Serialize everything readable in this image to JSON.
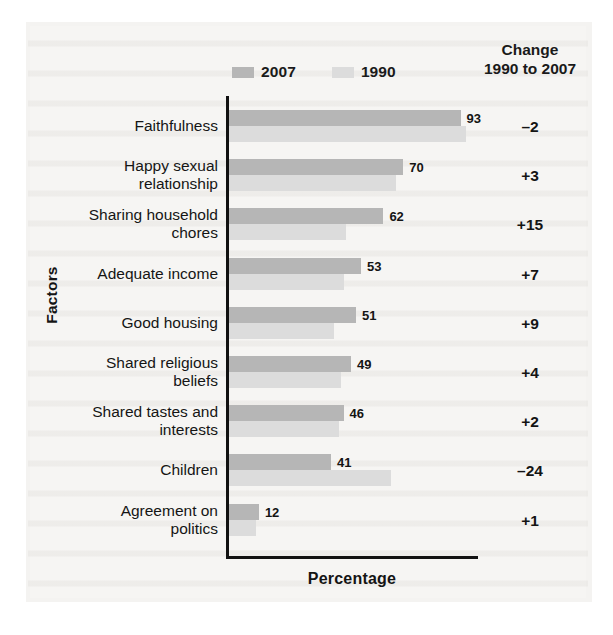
{
  "legend": {
    "items": [
      {
        "label": "2007",
        "color": "#b6b6b6",
        "swatch_name": "legend-swatch-2007"
      },
      {
        "label": "1990",
        "color": "#dcdcdc",
        "swatch_name": "legend-swatch-1990"
      }
    ]
  },
  "change_header": {
    "line1": "Change",
    "line2": "1990 to 2007"
  },
  "axes": {
    "y_title": "Factors",
    "x_title": "Percentage"
  },
  "chart_data": {
    "type": "bar",
    "orientation": "horizontal",
    "title": "",
    "subtitle": "",
    "xlabel": "Percentage",
    "ylabel": "Factors",
    "xlim": [
      0,
      100
    ],
    "grid": false,
    "legend_position": "top",
    "categories": [
      "Faithfulness",
      "Happy sexual relationship",
      "Sharing household chores",
      "Adequate income",
      "Good housing",
      "Shared religious beliefs",
      "Shared tastes and interests",
      "Children",
      "Agreement on politics"
    ],
    "series": [
      {
        "name": "2007",
        "color": "#b6b6b6",
        "values": [
          93,
          70,
          62,
          53,
          51,
          49,
          46,
          41,
          12
        ]
      },
      {
        "name": "1990",
        "color": "#dcdcdc",
        "values": [
          95,
          67,
          47,
          46,
          42,
          45,
          44,
          65,
          11
        ]
      }
    ],
    "annotations": {
      "column_header": "Change 1990 to 2007",
      "change_1990_to_2007": [
        "–2",
        "+3",
        "+15",
        "+7",
        "+9",
        "+4",
        "+2",
        "–24",
        "+1"
      ]
    }
  },
  "rows": [
    {
      "label_line1": "Faithfulness",
      "label_line2": "",
      "v2007": 93,
      "v1990": 95,
      "v2007_text": "93",
      "change": "–2"
    },
    {
      "label_line1": "Happy sexual",
      "label_line2": "relationship",
      "v2007": 70,
      "v1990": 67,
      "v2007_text": "70",
      "change": "+3"
    },
    {
      "label_line1": "Sharing household",
      "label_line2": "chores",
      "v2007": 62,
      "v1990": 47,
      "v2007_text": "62",
      "change": "+15"
    },
    {
      "label_line1": "Adequate income",
      "label_line2": "",
      "v2007": 53,
      "v1990": 46,
      "v2007_text": "53",
      "change": "+7"
    },
    {
      "label_line1": "Good housing",
      "label_line2": "",
      "v2007": 51,
      "v1990": 42,
      "v2007_text": "51",
      "change": "+9"
    },
    {
      "label_line1": "Shared religious",
      "label_line2": "beliefs",
      "v2007": 49,
      "v1990": 45,
      "v2007_text": "49",
      "change": "+4"
    },
    {
      "label_line1": "Shared tastes and",
      "label_line2": "interests",
      "v2007": 46,
      "v1990": 44,
      "v2007_text": "46",
      "change": "+2"
    },
    {
      "label_line1": "Children",
      "label_line2": "",
      "v2007": 41,
      "v1990": 65,
      "v2007_text": "41",
      "change": "–24"
    },
    {
      "label_line1": "Agreement on",
      "label_line2": "politics",
      "v2007": 12,
      "v1990": 11,
      "v2007_text": "12",
      "change": "+1"
    }
  ],
  "colors": {
    "bar_2007": "#b6b6b6",
    "bar_1990": "#dcdcdc",
    "axis": "#111111",
    "text": "#141414",
    "page": "#f6f5f3"
  }
}
